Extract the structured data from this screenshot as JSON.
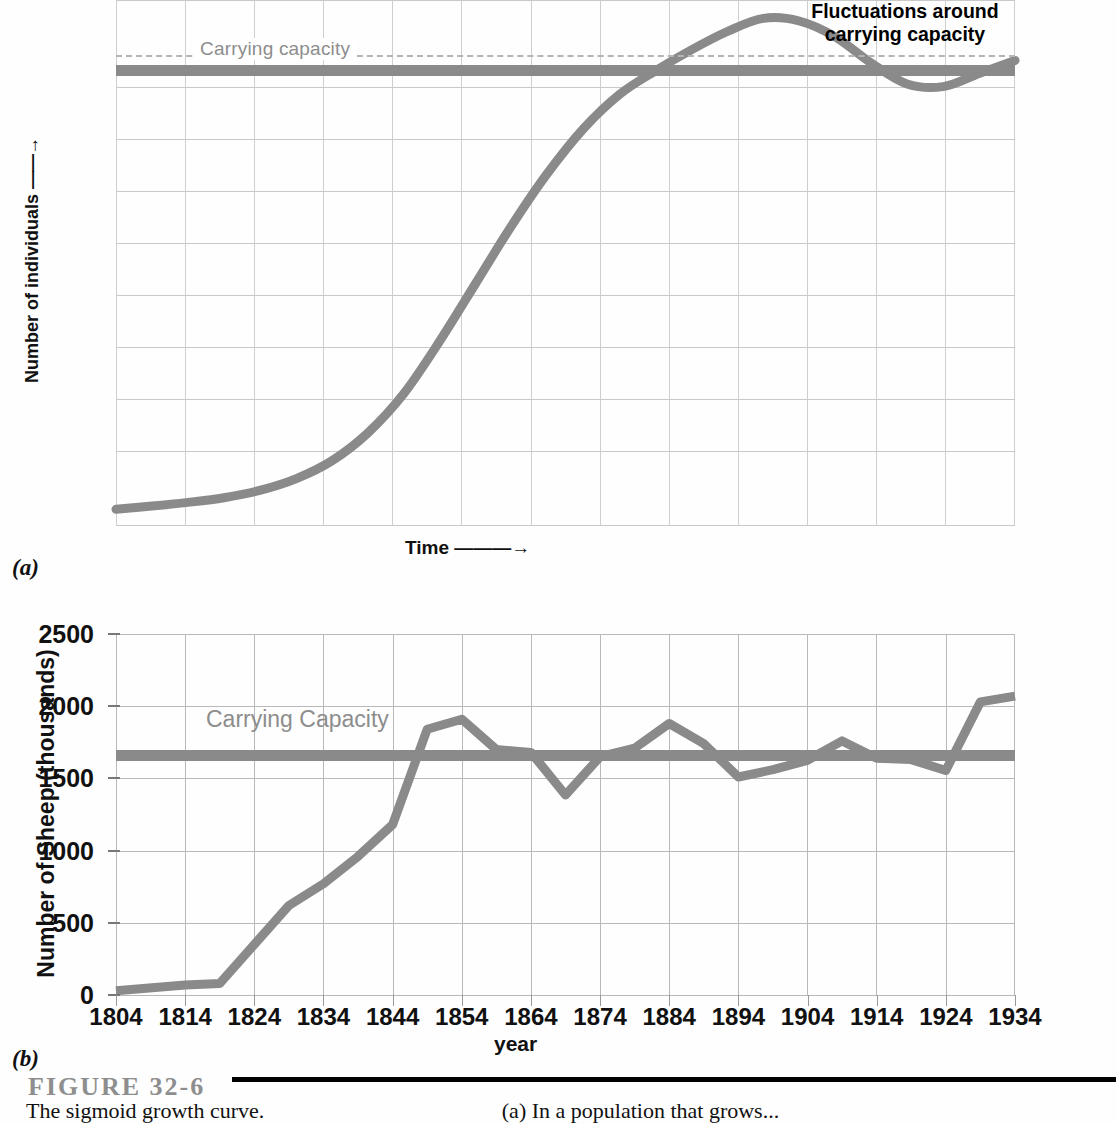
{
  "figure": {
    "number_label": "FIGURE 32-6",
    "caption_left_fragment": "The sigmoid growth curve.",
    "caption_right_fragment": "(a) In a population that grows..."
  },
  "panel_a": {
    "tag": "(a)",
    "y_axis_label": "Number of individuals",
    "y_axis_arrow": "——→",
    "x_axis_label": "Time",
    "x_axis_arrow": "———→",
    "carrying_capacity_label": "Carrying capacity",
    "annotation": "Fluctuations around carrying capacity",
    "annotation_line1": "Fluctuations around",
    "annotation_line2": "carrying capacity",
    "grid_columns": 13,
    "grid_rows": 10
  },
  "panel_b": {
    "tag": "(b)",
    "y_axis_label": "Number of Sheep (thousands)",
    "x_axis_label": "year",
    "carrying_capacity_label": "Carrying Capacity"
  },
  "colors": {
    "curve": "#8a8a8a",
    "carrying_capacity_line": "#8a8a8a",
    "carrying_capacity_text": "#8d8d8d",
    "grid": "#b9b9b9",
    "grid_light": "#cfcfcf",
    "axis_text": "#111111",
    "figure_number": "#8e8e8e",
    "background": "#fefefe"
  },
  "chart_data": [
    {
      "type": "line",
      "id": "panel-a-sigmoid",
      "title": "",
      "xlabel": "Time",
      "ylabel": "Number of individuals",
      "xlim": [
        0,
        100
      ],
      "ylim": [
        0,
        100
      ],
      "grid": true,
      "axis_tick_labels": false,
      "annotations": [
        {
          "text": "Carrying capacity",
          "x": 10,
          "y": 88
        },
        {
          "text": "Fluctuations around carrying capacity",
          "x": 76,
          "y": 100
        }
      ],
      "reference_lines": [
        {
          "name": "carrying capacity (dashed)",
          "y": 88,
          "style": "dashed",
          "color": "#b4b4b4"
        },
        {
          "name": "carrying capacity (solid)",
          "y": 86,
          "style": "solid",
          "color": "#8a8a8a"
        }
      ],
      "series": [
        {
          "name": "Logistic growth with overshoot and damped oscillation",
          "x": [
            0,
            4,
            8,
            12,
            16,
            20,
            24,
            28,
            32,
            36,
            40,
            44,
            48,
            52,
            56,
            60,
            64,
            68,
            72,
            76,
            80,
            84,
            88,
            92,
            96,
            100
          ],
          "y": [
            3,
            3.6,
            4.3,
            5.2,
            6.6,
            8.8,
            12.2,
            17.5,
            25,
            35,
            46,
            57,
            67,
            75.5,
            82,
            86.5,
            90.5,
            94,
            96.5,
            96,
            93,
            88,
            84,
            83.5,
            86,
            88.5
          ]
        }
      ]
    },
    {
      "type": "line",
      "id": "panel-b-tasmania-sheep",
      "title": "",
      "xlabel": "year",
      "ylabel": "Number of Sheep (thousands)",
      "xlim": [
        1804,
        1934
      ],
      "ylim": [
        0,
        2500
      ],
      "yticks": [
        0,
        500,
        1000,
        1500,
        2000,
        2500
      ],
      "xticks": [
        1804,
        1814,
        1824,
        1834,
        1844,
        1854,
        1864,
        1874,
        1884,
        1894,
        1904,
        1914,
        1924,
        1934
      ],
      "grid": true,
      "reference_lines": [
        {
          "name": "Carrying Capacity",
          "y": 1660,
          "style": "solid",
          "color": "#8a8a8a",
          "label": "Carrying Capacity"
        }
      ],
      "series": [
        {
          "name": "Number of Sheep (thousands)",
          "x": [
            1804,
            1814,
            1819,
            1824,
            1829,
            1834,
            1839,
            1844,
            1849,
            1854,
            1859,
            1864,
            1869,
            1874,
            1879,
            1884,
            1889,
            1894,
            1899,
            1904,
            1909,
            1914,
            1919,
            1924,
            1929,
            1934
          ],
          "y": [
            30,
            70,
            80,
            350,
            620,
            770,
            960,
            1180,
            1840,
            1910,
            1700,
            1680,
            1385,
            1650,
            1710,
            1880,
            1740,
            1510,
            1560,
            1625,
            1760,
            1640,
            1630,
            1555,
            2030,
            2070
          ]
        }
      ]
    }
  ]
}
